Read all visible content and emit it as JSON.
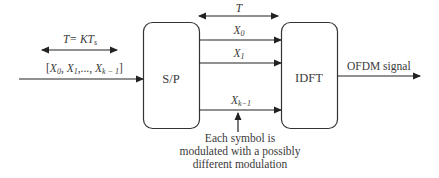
{
  "diagram": {
    "type": "block-diagram",
    "blocks": [
      {
        "id": "sp",
        "label": "S/P"
      },
      {
        "id": "idft",
        "label": "IDFT"
      }
    ],
    "input": {
      "period_label": "T= KT",
      "period_sub": "s",
      "vector_label_open": "[X",
      "vector_items": [
        {
          "base": "X",
          "sub": "0"
        },
        {
          "base": "X",
          "sub": "1"
        },
        {
          "base": "X",
          "sub": "k − 1"
        }
      ]
    },
    "parallel": {
      "period_label": "T",
      "streams": [
        {
          "base": "X",
          "sub": "0"
        },
        {
          "base": "X",
          "sub": "1"
        },
        {
          "base": "X",
          "sub": "k−1"
        }
      ]
    },
    "output": {
      "label": "OFDM signal"
    },
    "annotation": {
      "lines": [
        "Each symbol is",
        "modulated with a possibly",
        "different modulation"
      ]
    }
  }
}
